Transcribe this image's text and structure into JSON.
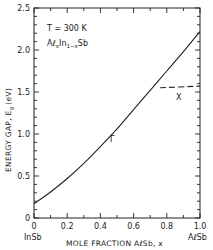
{
  "chart_data": {
    "type": "line",
    "title": "",
    "xlabel": "MOLE FRACTION AℓSb, x",
    "ylabel": "ENERGY GAP, E",
    "ylabel_sub": "g",
    "ylabel_unit": "(eV)",
    "xlim": [
      0,
      1.0
    ],
    "ylim": [
      0,
      2.5
    ],
    "x_ticks": [
      "0",
      "0.2",
      "0.4",
      "0.6",
      "0.8",
      "1.0"
    ],
    "y_ticks": [
      "0",
      "0.5",
      "1.0",
      "1.5",
      "2.0",
      "2.5"
    ],
    "x_end_labels": {
      "left": "InSb",
      "right": "AℓSb"
    },
    "grid": false,
    "annotations": {
      "temperature": "T = 300 K",
      "alloy_a": "Aℓ",
      "alloy_sub1": "x",
      "alloy_b": "In",
      "alloy_sub2": "1−x",
      "alloy_c": "Sb"
    },
    "series": [
      {
        "name": "Γ",
        "style": "solid",
        "x": [
          0,
          0.1,
          0.2,
          0.3,
          0.4,
          0.5,
          0.6,
          0.7,
          0.8,
          0.9,
          1.0
        ],
        "values": [
          0.17,
          0.31,
          0.47,
          0.65,
          0.85,
          1.06,
          1.29,
          1.52,
          1.75,
          1.98,
          2.22
        ]
      },
      {
        "name": "X",
        "style": "dashed",
        "x": [
          0.76,
          1.0
        ],
        "values": [
          1.55,
          1.57
        ]
      }
    ]
  }
}
